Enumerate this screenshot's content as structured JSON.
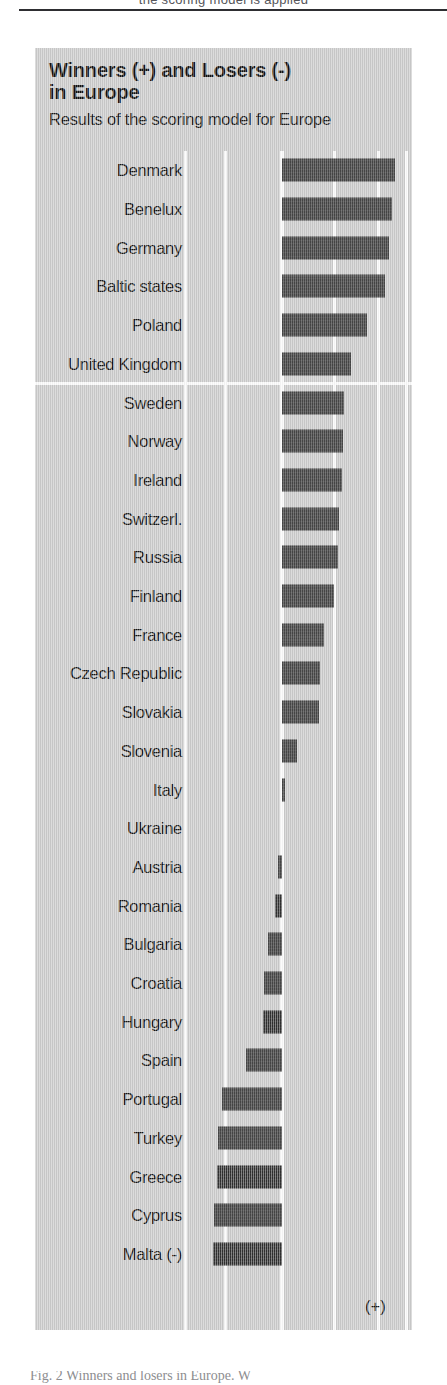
{
  "page": {
    "top_fragment_text": "the scoring model is applied",
    "figure_caption": "Fig. 2  Winners and losers in Europe. W"
  },
  "chart": {
    "title_line1": "Winners (+) and Losers (-)",
    "title_line2": "in Europe",
    "subtitle": "Results of the scoring model for Europe",
    "negative_marker": "(-)",
    "positive_marker": "(+)",
    "panel_color": "#cdcdcd",
    "bar_color": "#3a3a3a",
    "gridline_color": "#fbfbfb",
    "text_color": "#141414"
  },
  "chart_data": {
    "type": "bar",
    "orientation": "horizontal",
    "title": "Winners (+) and Losers (-) in Europe",
    "subtitle": "Results of the scoring model for Europe",
    "xlabel": "",
    "ylabel": "",
    "grid": true,
    "legend": false,
    "xlim": [
      -2.4,
      3.2
    ],
    "gridline_values": [
      -2.4,
      -1.4,
      1.3,
      2.4,
      3.1
    ],
    "zero_line": 0,
    "note": "Scores are estimated from bar lengths relative to the zero axis; axis is unlabeled in the figure.",
    "categories": [
      "Denmark",
      "Benelux",
      "Germany",
      "Baltic states",
      "Poland",
      "United Kingdom",
      "Sweden",
      "Norway",
      "Ireland",
      "Switzerl.",
      "Russia",
      "Finland",
      "France",
      "Czech Republic",
      "Slovakia",
      "Slovenia",
      "Italy",
      "Ukraine",
      "Austria",
      "Romania",
      "Bulgaria",
      "Croatia",
      "Hungary",
      "Spain",
      "Portugal",
      "Turkey",
      "Greece",
      "Cyprus",
      "Malta"
    ],
    "values": [
      2.8,
      2.72,
      2.65,
      2.55,
      2.1,
      1.7,
      1.55,
      1.52,
      1.5,
      1.42,
      1.4,
      1.3,
      1.05,
      0.95,
      0.92,
      0.38,
      0.06,
      0.0,
      -0.1,
      -0.18,
      -0.35,
      -0.45,
      -0.48,
      -0.9,
      -1.5,
      -1.6,
      -1.62,
      -1.68,
      -1.72
    ],
    "group_separator_after": "United Kingdom"
  }
}
